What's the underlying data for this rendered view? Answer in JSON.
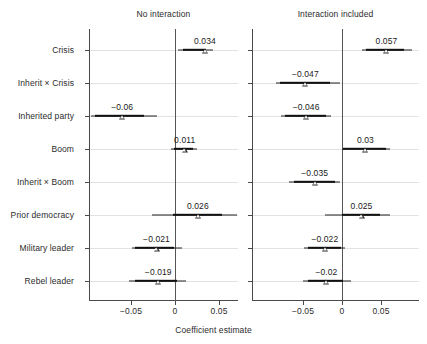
{
  "chart_data": {
    "type": "scatter",
    "title": "",
    "xlabel": "Coefficient estimate",
    "ylabel": "",
    "grid": true,
    "legend": "none",
    "xlim": [
      -0.092,
      0.078
    ],
    "xticks": [
      -0.05,
      0,
      0.05
    ],
    "xtick_labels": [
      "−0.05",
      "0",
      "0.05"
    ],
    "categories": [
      "Crisis",
      "Inherit × Crisis",
      "Inherited party",
      "Boom",
      "Inherit × Boom",
      "Prior democracy",
      "Military leader",
      "Rebel leader"
    ],
    "panels": [
      {
        "title": "No interaction",
        "points": [
          {
            "category": "Crisis",
            "estimate": 0.034,
            "label": "0.034",
            "ci_inner": [
              0.009,
              0.035
            ],
            "ci_outer": [
              0.003,
              0.043
            ]
          },
          {
            "category": "Inherit × Crisis",
            "estimate": null,
            "label": "",
            "ci_inner": null,
            "ci_outer": null
          },
          {
            "category": "Inherited party",
            "estimate": -0.06,
            "label": "−0.06",
            "ci_inner": [
              -0.091,
              -0.035
            ],
            "ci_outer": [
              -0.095,
              -0.021
            ]
          },
          {
            "category": "Boom",
            "estimate": 0.011,
            "label": "0.011",
            "ci_inner": [
              -0.001,
              0.02
            ],
            "ci_outer": [
              -0.005,
              0.025
            ]
          },
          {
            "category": "Inherit × Boom",
            "estimate": null,
            "label": "",
            "ci_inner": null,
            "ci_outer": null
          },
          {
            "category": "Prior democracy",
            "estimate": 0.026,
            "label": "0.026",
            "ci_inner": [
              -0.002,
              0.053
            ],
            "ci_outer": [
              -0.026,
              0.071
            ]
          },
          {
            "category": "Military leader",
            "estimate": -0.021,
            "label": "−0.021",
            "ci_inner": [
              -0.045,
              -0.001
            ],
            "ci_outer": [
              -0.049,
              0.008
            ]
          },
          {
            "category": "Rebel leader",
            "estimate": -0.019,
            "label": "−0.019",
            "ci_inner": [
              -0.046,
              0.002
            ],
            "ci_outer": [
              -0.052,
              0.013
            ]
          }
        ]
      },
      {
        "title": "Interaction included",
        "points": [
          {
            "category": "Crisis",
            "estimate": 0.057,
            "label": "0.057",
            "ci_inner": [
              0.031,
              0.079
            ],
            "ci_outer": [
              0.026,
              0.09
            ]
          },
          {
            "category": "Inherit × Crisis",
            "estimate": -0.047,
            "label": "−0.047",
            "ci_inner": [
              -0.08,
              -0.016
            ],
            "ci_outer": [
              -0.085,
              -0.003
            ]
          },
          {
            "category": "Inherited party",
            "estimate": -0.046,
            "label": "−0.046",
            "ci_inner": [
              -0.073,
              -0.02
            ],
            "ci_outer": [
              -0.078,
              -0.014
            ]
          },
          {
            "category": "Boom",
            "estimate": 0.03,
            "label": "0.03",
            "ci_inner": [
              0.001,
              0.056
            ],
            "ci_outer": [
              0.0,
              0.062
            ]
          },
          {
            "category": "Inherit × Boom",
            "estimate": -0.035,
            "label": "−0.035",
            "ci_inner": [
              -0.062,
              -0.009
            ],
            "ci_outer": [
              -0.068,
              -0.002
            ]
          },
          {
            "category": "Prior democracy",
            "estimate": 0.025,
            "label": "0.025",
            "ci_inner": [
              0.0,
              0.049
            ],
            "ci_outer": [
              -0.022,
              0.062
            ]
          },
          {
            "category": "Military leader",
            "estimate": -0.022,
            "label": "−0.022",
            "ci_inner": [
              -0.044,
              -0.001
            ],
            "ci_outer": [
              -0.049,
              0.004
            ]
          },
          {
            "category": "Rebel leader",
            "estimate": -0.02,
            "label": "−0.02",
            "ci_inner": [
              -0.044,
              0.001
            ],
            "ci_outer": [
              -0.05,
              0.011
            ]
          }
        ]
      }
    ]
  }
}
